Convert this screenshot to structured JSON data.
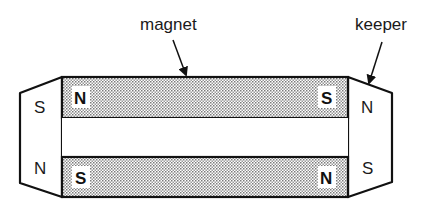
{
  "labels": {
    "magnet": "magnet",
    "keeper": "keeper"
  },
  "magnet_bars": {
    "top": {
      "left_pole": "N",
      "right_pole": "S"
    },
    "bottom": {
      "left_pole": "S",
      "right_pole": "N"
    }
  },
  "keepers": {
    "left": {
      "top_pole": "S",
      "bottom_pole": "N"
    },
    "right": {
      "top_pole": "N",
      "bottom_pole": "S"
    }
  },
  "colors": {
    "stroke": "#111111",
    "fill_dots": "#888888",
    "background": "#ffffff"
  }
}
